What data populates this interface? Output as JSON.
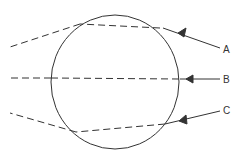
{
  "diagram": {
    "colors": {
      "stroke": "#333333",
      "background": "#ffffff"
    },
    "sphere": {
      "cx": 115,
      "cy": 82,
      "rx": 64,
      "ry": 67
    },
    "rays": [
      {
        "label": "A",
        "label_x": 223,
        "label_y": 53,
        "incident": "M220,48 L163,28",
        "arrow": "M178,34 L186,29 L183,37 Z",
        "inside": "M160,28 L80,24",
        "exit": "M80,24 L10,47"
      },
      {
        "label": "B",
        "label_x": 223,
        "label_y": 83,
        "incident": "M220,79 L180,79",
        "arrow": "M186,79 L193,75 L193,83 Z",
        "inside": "M179,79 L51,78",
        "exit": "M51,78 L8,78"
      },
      {
        "label": "C",
        "label_x": 223,
        "label_y": 114,
        "incident": "M220,111 L165,124",
        "arrow": "M180,121 L186,116 L187,124 Z",
        "inside": "M165,124 L76,132",
        "exit": "M76,132 L10,113"
      }
    ]
  }
}
